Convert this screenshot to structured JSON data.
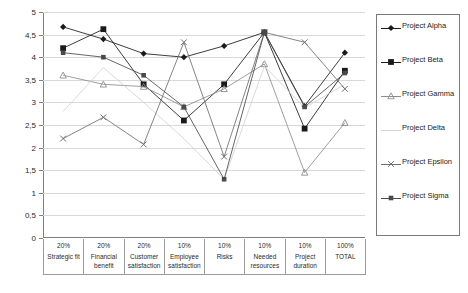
{
  "chart_data": {
    "type": "line",
    "title": "",
    "xlabel": "",
    "ylabel": "",
    "ylim": [
      0,
      5
    ],
    "ytick_step": 0.5,
    "grid": true,
    "legend_position": "right",
    "decimal_separator": ",",
    "categories": [
      "Strategic fit",
      "Financial benefit",
      "Customer satisfaction",
      "Employee satisfaction",
      "Risks",
      "Needed resources",
      "Project duration",
      "TOTAL"
    ],
    "category_weights": [
      "20%",
      "20%",
      "20%",
      "10%",
      "10%",
      "10%",
      "10%",
      "100%"
    ],
    "ytick_labels": [
      "0",
      "0,5",
      "1",
      "1,5",
      "2",
      "2,5",
      "3",
      "3,5",
      "4",
      "4,5",
      "5"
    ],
    "ytick_values": [
      0,
      0.5,
      1,
      1.5,
      2,
      2.5,
      3,
      3.5,
      4,
      4.5,
      5
    ],
    "series": [
      {
        "name": "Project Alpha",
        "marker": "diamond",
        "color": "#1a1a1a",
        "values": [
          4.67,
          4.4,
          4.08,
          4.0,
          4.25,
          4.55,
          2.92,
          4.1
        ]
      },
      {
        "name": "Project Beta",
        "marker": "square",
        "color": "#1a1a1a",
        "values": [
          4.2,
          4.62,
          3.4,
          2.6,
          3.4,
          4.55,
          2.42,
          3.7
        ]
      },
      {
        "name": "Project Gamma",
        "marker": "triangle",
        "color": "#8c8c8c",
        "values": [
          3.6,
          3.4,
          3.35,
          2.9,
          3.3,
          3.85,
          1.45,
          2.55
        ]
      },
      {
        "name": "Project Delta",
        "marker": "none",
        "color": "#d2d2d2",
        "values": [
          2.8,
          3.77,
          3.0,
          2.2,
          1.3,
          3.8,
          2.88,
          3.4
        ]
      },
      {
        "name": "Project Epsilon",
        "marker": "cross",
        "color": "#6e6e6e",
        "values": [
          2.2,
          2.67,
          2.07,
          4.33,
          1.8,
          4.55,
          4.33,
          3.3
        ]
      },
      {
        "name": "Project Sigma",
        "marker": "square-small",
        "color": "#4a4a4a",
        "values": [
          4.1,
          4.0,
          3.6,
          2.9,
          1.3,
          4.55,
          2.9,
          3.65
        ]
      }
    ]
  },
  "legend": {
    "items": [
      {
        "label": "Project Alpha"
      },
      {
        "label": "Project Beta"
      },
      {
        "label": "Project Gamma"
      },
      {
        "label": "Project Delta"
      },
      {
        "label": "Project Epsilon"
      },
      {
        "label": "Project Sigma"
      }
    ]
  }
}
